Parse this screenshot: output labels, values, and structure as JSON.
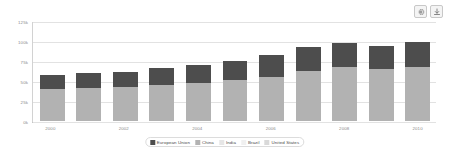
{
  "toolbar": {
    "settings_icon": "gear-icon",
    "download_icon": "download-icon"
  },
  "colors": {
    "european_union": "#4d4d4d",
    "china": "#b2b2b2",
    "india": "#e6e6e6",
    "brazil": "#f0f0f0",
    "united_states": "#d9d9d9",
    "gridline": "#e2e2e2",
    "axis": "#b9b9b9",
    "tick_text": "#8a8a8a"
  },
  "chart_data": {
    "type": "bar",
    "stacked": true,
    "title": "",
    "xlabel": "",
    "ylabel": "",
    "ylim": [
      0,
      125000
    ],
    "grid": true,
    "legend_position": "bottom",
    "categories": [
      "2000",
      "2001",
      "2002",
      "2003",
      "2004",
      "2005",
      "2006",
      "2007",
      "2008",
      "2009",
      "2010"
    ],
    "tick_labels_x": [
      "2000",
      "",
      "2002",
      "",
      "2004",
      "",
      "2006",
      "",
      "2008",
      "",
      "2010"
    ],
    "tick_labels_y": [
      "125k",
      "100k",
      "75k",
      "50k",
      "25k",
      "0k"
    ],
    "tick_values_y": [
      125000,
      100000,
      75000,
      50000,
      25000,
      0
    ],
    "series": [
      {
        "name": "European Union",
        "color": "#4d4d4d",
        "values": [
          18000,
          18500,
          19000,
          21000,
          22500,
          24000,
          27000,
          30000,
          31000,
          29000,
          31000
        ]
      },
      {
        "name": "China",
        "color": "#b2b2b2",
        "values": [
          40000,
          41000,
          42500,
          45500,
          48000,
          51500,
          55000,
          62000,
          67000,
          65000,
          68000
        ]
      },
      {
        "name": "India",
        "color": "#e6e6e6",
        "values": [
          0,
          0,
          0,
          0,
          0,
          0,
          0,
          0,
          0,
          0,
          0
        ]
      },
      {
        "name": "Brazil",
        "color": "#f0f0f0",
        "values": [
          0,
          0,
          0,
          0,
          0,
          0,
          0,
          0,
          0,
          0,
          0
        ]
      },
      {
        "name": "United States",
        "color": "#d9d9d9",
        "values": [
          0,
          0,
          0,
          0,
          0,
          0,
          0,
          0,
          0,
          0,
          0
        ]
      }
    ],
    "totals": [
      58000,
      59500,
      61500,
      66500,
      70500,
      75500,
      82000,
      92000,
      98000,
      94000,
      99000
    ]
  }
}
